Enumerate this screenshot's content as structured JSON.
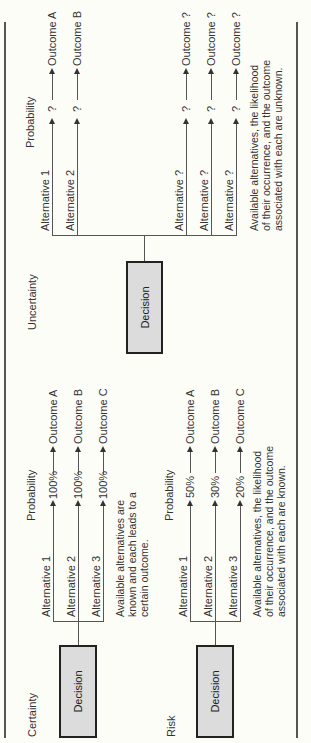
{
  "diagram": {
    "sections": [
      {
        "id": "certainty",
        "title": "Certainty",
        "column_header": "Probability",
        "decision_label": "Decision",
        "alternatives": [
          {
            "label": "Alternative 1",
            "probability": "100%",
            "outcome": "Outcome A"
          },
          {
            "label": "Alternative 2",
            "probability": "100%",
            "outcome": "Outcome B"
          },
          {
            "label": "Alternative 3",
            "probability": "100%",
            "outcome": "Outcome C"
          }
        ],
        "description": [
          "Available alternatives are",
          "known and each leads to a",
          "certain outcome."
        ]
      },
      {
        "id": "risk",
        "title": "Risk",
        "column_header": "Probability",
        "decision_label": "Decision",
        "alternatives": [
          {
            "label": "Alternative 1",
            "probability": "50%",
            "outcome": "Outcome A"
          },
          {
            "label": "Alternative 2",
            "probability": "30%",
            "outcome": "Outcome B"
          },
          {
            "label": "Alternative 3",
            "probability": "20%",
            "outcome": "Outcome C"
          }
        ],
        "description": [
          "Available alternatives, the likelihood",
          "of their occurrence, and the outcome",
          "associated with each are known."
        ]
      },
      {
        "id": "uncertainty",
        "title": "Uncertainty",
        "column_header": "Probability",
        "decision_label": "Decision",
        "alternatives": [
          {
            "label": "Alternative 1",
            "probability": "?",
            "outcome": "Outcome A"
          },
          {
            "label": "Alternative 2",
            "probability": "?",
            "outcome": "Outcome B"
          },
          {
            "label": "Alternative ?",
            "probability": "?",
            "outcome": "Outcome ?"
          },
          {
            "label": "Alternative ?",
            "probability": "?",
            "outcome": "Outcome ?"
          },
          {
            "label": "Alternative ?",
            "probability": "?",
            "outcome": "Outcome ?"
          }
        ],
        "description": [
          "Available alternatives, the likelihood",
          "of their occurrence, and the outcome",
          "associated with each are unknown."
        ]
      }
    ]
  },
  "colors": {
    "decision_box_fill": "#dcdcdc",
    "line": "#555555",
    "background": "#fdfdf8"
  }
}
